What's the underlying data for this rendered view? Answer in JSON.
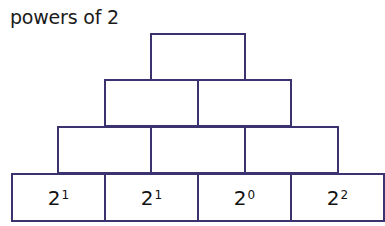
{
  "title": "powers of 2",
  "pyramid": {
    "row1": [
      {
        "base": "",
        "exp": ""
      }
    ],
    "row2": [
      {
        "base": "",
        "exp": ""
      },
      {
        "base": "",
        "exp": ""
      }
    ],
    "row3": [
      {
        "base": "",
        "exp": ""
      },
      {
        "base": "",
        "exp": ""
      },
      {
        "base": "",
        "exp": ""
      }
    ],
    "row4": [
      {
        "base": "2",
        "exp": "1"
      },
      {
        "base": "2",
        "exp": "1"
      },
      {
        "base": "2",
        "exp": "0"
      },
      {
        "base": "2",
        "exp": "2"
      }
    ]
  },
  "colors": {
    "border": "#3b3270"
  }
}
